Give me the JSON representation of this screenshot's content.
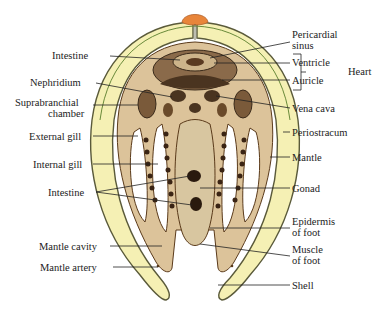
{
  "figure": {
    "colors": {
      "shell": "#f5f0b4",
      "shell_outline": "#5a5a3a",
      "tissue": "#dcc39a",
      "tissue_dark": "#6b4a2a",
      "hinge_ligament": "#e8853a",
      "label_text": "#222222",
      "leader_line": "#222222"
    },
    "labels_left": [
      {
        "id": "intestine-top",
        "text": "Intestine"
      },
      {
        "id": "nephridium",
        "text": "Nephridium"
      },
      {
        "id": "suprabranchial-1",
        "text": "Suprabranchial"
      },
      {
        "id": "suprabranchial-2",
        "text": "chamber"
      },
      {
        "id": "external-gill",
        "text": "External gill"
      },
      {
        "id": "internal-gill",
        "text": "Internal gill"
      },
      {
        "id": "intestine-bottom",
        "text": "Intestine"
      },
      {
        "id": "mantle-cavity",
        "text": "Mantle cavity"
      },
      {
        "id": "mantle-artery",
        "text": "Mantle artery"
      }
    ],
    "labels_right": [
      {
        "id": "pericardial-1",
        "text": "Pericardial"
      },
      {
        "id": "pericardial-2",
        "text": "sinus"
      },
      {
        "id": "ventricle",
        "text": "Ventricle"
      },
      {
        "id": "auricle",
        "text": "Auricle"
      },
      {
        "id": "heart",
        "text": "Heart"
      },
      {
        "id": "vena-cava",
        "text": "Vena cava"
      },
      {
        "id": "periostracum",
        "text": "Periostracum"
      },
      {
        "id": "mantle",
        "text": "Mantle"
      },
      {
        "id": "gonad",
        "text": "Gonad"
      },
      {
        "id": "epidermis-1",
        "text": "Epidermis"
      },
      {
        "id": "epidermis-2",
        "text": "of foot"
      },
      {
        "id": "muscle-1",
        "text": "Muscle"
      },
      {
        "id": "muscle-2",
        "text": "of foot"
      },
      {
        "id": "shell",
        "text": "Shell"
      }
    ]
  }
}
